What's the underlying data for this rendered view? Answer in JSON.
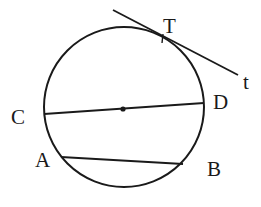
{
  "diagram": {
    "type": "geometry-circle",
    "background": "#ffffff",
    "stroke_color": "#1a1a1a",
    "circle": {
      "cx": 124,
      "cy": 107,
      "r": 80,
      "stroke_width": 2
    },
    "center_point": {
      "x": 123,
      "y": 109,
      "r": 2.6
    },
    "diameter_CD": {
      "x1": 44,
      "y1": 114,
      "x2": 204,
      "y2": 103
    },
    "chord_AB": {
      "x1": 61,
      "y1": 157,
      "x2": 183,
      "y2": 164
    },
    "tangent_line": {
      "x1": 113,
      "y1": 10,
      "x2": 238,
      "y2": 75
    },
    "tangent_tick": {
      "x1": 163,
      "y1": 34,
      "x2": 162,
      "y2": 43
    },
    "labels": {
      "T": {
        "text": "T",
        "x": 163,
        "y": 33
      },
      "t": {
        "text": "t",
        "x": 243,
        "y": 89
      },
      "C": {
        "text": "C",
        "x": 11,
        "y": 124
      },
      "D": {
        "text": "D",
        "x": 213,
        "y": 109
      },
      "A": {
        "text": "A",
        "x": 35,
        "y": 167
      },
      "B": {
        "text": "B",
        "x": 207,
        "y": 176
      }
    }
  }
}
